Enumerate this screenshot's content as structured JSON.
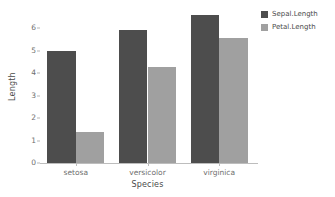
{
  "chart_data": {
    "type": "bar",
    "title": "",
    "xlabel": "Species",
    "ylabel": "Length",
    "categories": [
      "setosa",
      "versicolor",
      "virginica"
    ],
    "series": [
      {
        "name": "Sepal.Length",
        "color": "#4d4d4d",
        "values": [
          5.0,
          5.9,
          6.6
        ]
      },
      {
        "name": "Petal.Length",
        "color": "#a0a0a0",
        "values": [
          1.4,
          4.26,
          5.55
        ]
      }
    ],
    "ylim": [
      0,
      6.9
    ],
    "yticks": [
      0,
      1,
      2,
      3,
      4,
      5,
      6
    ],
    "ytick_labels": [
      "0",
      "1",
      "2",
      "3",
      "4",
      "5",
      "6"
    ],
    "grid": false,
    "legend_position": "right",
    "bar_mode": "grouped"
  },
  "axes": {
    "y_title": "Length",
    "x_title": "Species"
  },
  "legend": {
    "entries": [
      {
        "label": "Sepal.Length"
      },
      {
        "label": "Petal.Length"
      }
    ]
  }
}
